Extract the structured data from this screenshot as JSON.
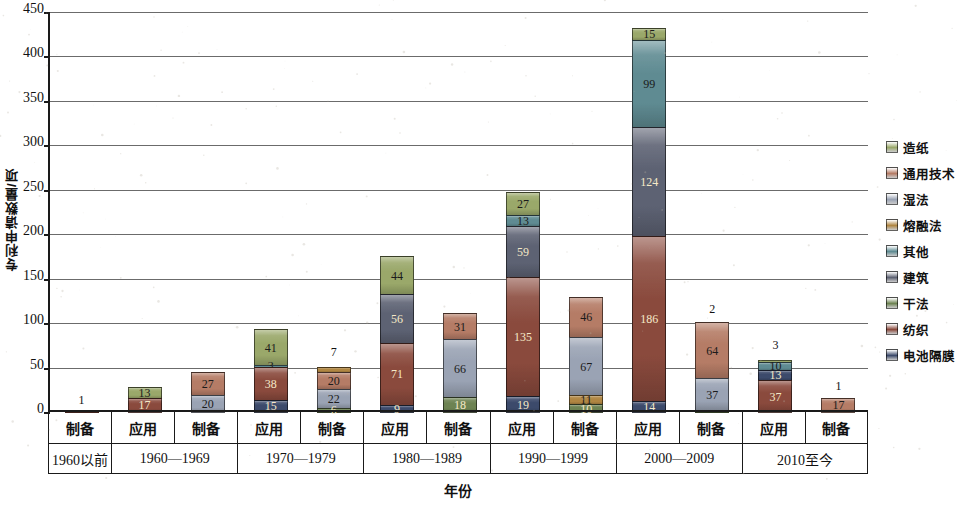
{
  "chart_data": {
    "type": "bar",
    "subtype": "stacked-bar",
    "title": "",
    "xlabel": "年份",
    "ylabel": "专利申请数量/项",
    "ylim": [
      0,
      450
    ],
    "ytick_step": 50,
    "yticks": [
      "450",
      "400",
      "350",
      "300",
      "250",
      "200",
      "150",
      "100",
      "50",
      "0"
    ],
    "grid": true,
    "legend_position": "right",
    "legend": [
      "造纸",
      "通用技术",
      "湿法",
      "熔融法",
      "其他",
      "建筑",
      "干法",
      "纺织",
      "电池隔膜"
    ],
    "colors": {
      "造纸": "#9aa86a",
      "通用技术": "#b57c66",
      "湿法": "#9aa3b4",
      "熔融法": "#b08642",
      "其他": "#5f8b92",
      "建筑": "#5d6273",
      "干法": "#6d8352",
      "纺织": "#8a4a3d",
      "电池隔膜": "#3c4a6b"
    },
    "groups": [
      "1960以前",
      "1960—1969",
      "1970—1979",
      "1980—1989",
      "1990—1999",
      "2000—2009",
      "2010至今"
    ],
    "subcategories": [
      "应用",
      "制备"
    ],
    "bars": [
      {
        "group": "1960以前",
        "subcategory": "制备",
        "total": 1,
        "total_label": "1",
        "segments": [
          {
            "series": "纺织",
            "value": 1,
            "label": "1",
            "show_label": false
          }
        ]
      },
      {
        "group": "1960—1969",
        "subcategory": "应用",
        "total": 30,
        "total_label": "",
        "segments": [
          {
            "series": "纺织",
            "value": 17,
            "label": "17",
            "show_label": true
          },
          {
            "series": "造纸",
            "value": 13,
            "label": "13",
            "show_label": true
          }
        ]
      },
      {
        "group": "1960—1969",
        "subcategory": "制备",
        "total": 47,
        "total_label": "",
        "segments": [
          {
            "series": "湿法",
            "value": 20,
            "label": "20",
            "show_label": true
          },
          {
            "series": "通用技术",
            "value": 27,
            "label": "27",
            "show_label": true
          }
        ]
      },
      {
        "group": "1970—1979",
        "subcategory": "应用",
        "total": 97,
        "total_label": "",
        "segments": [
          {
            "series": "电池隔膜",
            "value": 15,
            "label": "15",
            "show_label": true
          },
          {
            "series": "纺织",
            "value": 38,
            "label": "38",
            "show_label": true
          },
          {
            "series": "其他",
            "value": 3,
            "label": "3",
            "show_label": true
          },
          {
            "series": "造纸",
            "value": 41,
            "label": "41",
            "show_label": true
          }
        ]
      },
      {
        "group": "1970—1979",
        "subcategory": "制备",
        "total": 55,
        "total_label": "7",
        "segments": [
          {
            "series": "干法",
            "value": 6,
            "label": "6",
            "show_label": true
          },
          {
            "series": "湿法",
            "value": 22,
            "label": "22",
            "show_label": true
          },
          {
            "series": "通用技术",
            "value": 20,
            "label": "20",
            "show_label": true
          },
          {
            "series": "熔融法",
            "value": 7,
            "label": "7",
            "show_label": false
          }
        ]
      },
      {
        "group": "1980—1989",
        "subcategory": "应用",
        "total": 180,
        "total_label": "",
        "segments": [
          {
            "series": "电池隔膜",
            "value": 9,
            "label": "9",
            "show_label": true
          },
          {
            "series": "纺织",
            "value": 71,
            "label": "71",
            "show_label": true
          },
          {
            "series": "建筑",
            "value": 56,
            "label": "56",
            "show_label": true
          },
          {
            "series": "造纸",
            "value": 44,
            "label": "44",
            "show_label": true
          }
        ]
      },
      {
        "group": "1980—1989",
        "subcategory": "制备",
        "total": 115,
        "total_label": "",
        "segments": [
          {
            "series": "干法",
            "value": 18,
            "label": "18",
            "show_label": true
          },
          {
            "series": "湿法",
            "value": 66,
            "label": "66",
            "show_label": true
          },
          {
            "series": "通用技术",
            "value": 31,
            "label": "31",
            "show_label": true
          }
        ]
      },
      {
        "group": "1990—1999",
        "subcategory": "应用",
        "total": 253,
        "total_label": "",
        "segments": [
          {
            "series": "电池隔膜",
            "value": 19,
            "label": "19",
            "show_label": true
          },
          {
            "series": "纺织",
            "value": 135,
            "label": "135",
            "show_label": true
          },
          {
            "series": "建筑",
            "value": 59,
            "label": "59",
            "show_label": true
          },
          {
            "series": "其他",
            "value": 13,
            "label": "13",
            "show_label": true
          },
          {
            "series": "造纸",
            "value": 27,
            "label": "27",
            "show_label": true
          }
        ]
      },
      {
        "group": "1990—1999",
        "subcategory": "制备",
        "total": 134,
        "total_label": "",
        "segments": [
          {
            "series": "干法",
            "value": 10,
            "label": "10",
            "show_label": true
          },
          {
            "series": "熔融法",
            "value": 11,
            "label": "11",
            "show_label": true
          },
          {
            "series": "湿法",
            "value": 67,
            "label": "67",
            "show_label": true
          },
          {
            "series": "通用技术",
            "value": 46,
            "label": "46",
            "show_label": true
          }
        ]
      },
      {
        "group": "2000—2009",
        "subcategory": "应用",
        "total": 438,
        "total_label": "",
        "segments": [
          {
            "series": "电池隔膜",
            "value": 14,
            "label": "14",
            "show_label": true
          },
          {
            "series": "纺织",
            "value": 186,
            "label": "186",
            "show_label": true
          },
          {
            "series": "建筑",
            "value": 124,
            "label": "124",
            "show_label": true
          },
          {
            "series": "其他",
            "value": 99,
            "label": "99",
            "show_label": true
          },
          {
            "series": "造纸",
            "value": 15,
            "label": "15",
            "show_label": true
          }
        ]
      },
      {
        "group": "2000—2009",
        "subcategory": "制备",
        "total": 103,
        "total_label": "2",
        "segments": [
          {
            "series": "干法",
            "value": 2,
            "label": "2",
            "show_label": false
          },
          {
            "series": "湿法",
            "value": 37,
            "label": "37",
            "show_label": true
          },
          {
            "series": "通用技术",
            "value": 64,
            "label": "64",
            "show_label": true
          }
        ]
      },
      {
        "group": "2010至今",
        "subcategory": "应用",
        "total": 63,
        "total_label": "3",
        "segments": [
          {
            "series": "纺织",
            "value": 37,
            "label": "37",
            "show_label": true
          },
          {
            "series": "电池隔膜",
            "value": 13,
            "label": "13",
            "show_label": true
          },
          {
            "series": "其他",
            "value": 10,
            "label": "10",
            "show_label": true
          },
          {
            "series": "造纸",
            "value": 3,
            "label": "3",
            "show_label": false
          }
        ]
      },
      {
        "group": "2010至今",
        "subcategory": "制备",
        "total": 17,
        "total_label": "1",
        "segments": [
          {
            "series": "通用技术",
            "value": 17,
            "label": "17",
            "show_label": true
          }
        ]
      }
    ]
  },
  "axis": {
    "y_title": "专利申请数量/项",
    "x_title": "年份"
  }
}
